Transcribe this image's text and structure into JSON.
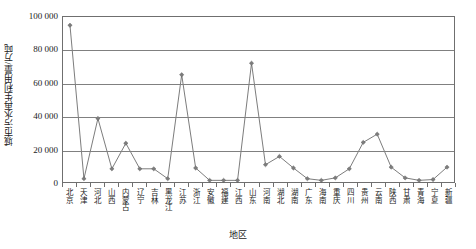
{
  "chart_data": {
    "type": "line",
    "title": "",
    "xlabel": "地区",
    "ylabel": "城市污水再生利用量/万吨",
    "ylim": [
      0,
      100000
    ],
    "ytick_labels": [
      "0",
      "20 000",
      "40 000",
      "60 000",
      "80 000",
      "100 000"
    ],
    "ytick_values": [
      0,
      20000,
      40000,
      60000,
      80000,
      100000
    ],
    "grid": true,
    "legend": "none",
    "marker": "diamond",
    "series_color": "#7c7c7c",
    "line_color": "#595959",
    "categories": [
      "北京",
      "天津",
      "河北",
      "山西",
      "内蒙古",
      "辽宁",
      "吉林",
      "黑龙江",
      "江苏",
      "浙江",
      "安徽",
      "福建",
      "江西",
      "山东",
      "河南",
      "湖北",
      "湖南",
      "广东",
      "海南",
      "重庆",
      "四川",
      "贵州",
      "云南",
      "陕西",
      "甘肃",
      "青海",
      "宁夏",
      "新疆"
    ],
    "values": [
      95000,
      2000,
      38500,
      8000,
      23500,
      8000,
      8000,
      2000,
      65000,
      8500,
      1000,
      1000,
      1000,
      72000,
      10500,
      15500,
      8500,
      2000,
      1000,
      2500,
      8000,
      24000,
      29000,
      9000,
      2500,
      1000,
      1500,
      9000
    ]
  }
}
